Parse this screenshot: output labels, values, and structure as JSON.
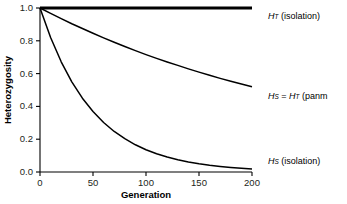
{
  "figure": {
    "background": "#ffffff",
    "ink_color": "#000000",
    "text_color": "#231f20"
  },
  "axes": {
    "x": {
      "title": "Generation",
      "ticks": [
        0,
        50,
        100,
        150,
        200
      ],
      "tick_labels": [
        "0",
        "50",
        "100",
        "150",
        "200"
      ],
      "range": [
        0,
        200
      ]
    },
    "y": {
      "title": "Heterozygosity",
      "ticks": [
        0.0,
        0.2,
        0.4,
        0.6,
        0.8,
        1.0
      ],
      "tick_labels": [
        "0.0",
        "0.2",
        "0.4",
        "0.6",
        "0.8",
        "1.0"
      ],
      "range": [
        0.0,
        1.0
      ]
    }
  },
  "legend": {
    "items": [
      {
        "id": "ht-isolation",
        "symbol": "H",
        "subscript": "T",
        "suffix": " (isolation)",
        "full_text": "H_T (isolation)",
        "y_px": 12
      },
      {
        "id": "hs-equals-ht-panmixia",
        "symbol": "H",
        "subscript": "S",
        "equals": " = ",
        "symbol2": "H",
        "subscript2": "T",
        "suffix": " (panm",
        "full_text": "H_S = H_T (panm",
        "clipped": true,
        "y_px": 92
      },
      {
        "id": "hs-isolation",
        "symbol": "H",
        "subscript": "S",
        "suffix": " (isolation)",
        "full_text": "H_S (isolation)",
        "y_px": 157
      }
    ]
  },
  "chart_data": {
    "type": "line",
    "title": "",
    "xlabel": "Generation",
    "ylabel": "Heterozygosity",
    "xlim": [
      0,
      200
    ],
    "ylim": [
      0.0,
      1.0
    ],
    "grid": false,
    "legend_position": "right",
    "x": [
      0,
      10,
      20,
      30,
      40,
      50,
      60,
      70,
      80,
      90,
      100,
      110,
      120,
      130,
      140,
      150,
      160,
      170,
      180,
      190,
      200
    ],
    "series": [
      {
        "name": "H_T (isolation)",
        "style": "thick",
        "values": [
          1.0,
          1.0,
          1.0,
          1.0,
          1.0,
          1.0,
          1.0,
          1.0,
          1.0,
          1.0,
          1.0,
          1.0,
          1.0,
          1.0,
          1.0,
          1.0,
          1.0,
          1.0,
          1.0,
          1.0,
          1.0
        ]
      },
      {
        "name": "H_S = H_T (panmixia)",
        "style": "thin",
        "values": [
          1.0,
          0.967,
          0.935,
          0.904,
          0.875,
          0.846,
          0.818,
          0.791,
          0.765,
          0.74,
          0.716,
          0.693,
          0.671,
          0.65,
          0.629,
          0.609,
          0.59,
          0.571,
          0.553,
          0.536,
          0.52
        ]
      },
      {
        "name": "H_S (isolation)",
        "style": "thin",
        "values": [
          1.0,
          0.82,
          0.672,
          0.55,
          0.45,
          0.369,
          0.302,
          0.247,
          0.203,
          0.166,
          0.136,
          0.111,
          0.091,
          0.075,
          0.061,
          0.05,
          0.041,
          0.034,
          0.028,
          0.023,
          0.019
        ]
      }
    ]
  }
}
